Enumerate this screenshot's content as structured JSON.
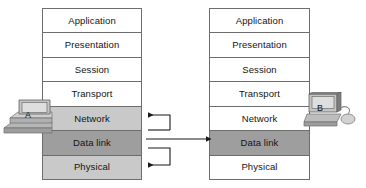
{
  "diagram": {
    "layers": [
      "Application",
      "Presentation",
      "Session",
      "Transport",
      "Network",
      "Data link",
      "Physical"
    ],
    "stack_a": {
      "device_label": "A",
      "layers": [
        {
          "name": "Application",
          "shade": "white"
        },
        {
          "name": "Presentation",
          "shade": "white"
        },
        {
          "name": "Session",
          "shade": "white"
        },
        {
          "name": "Transport",
          "shade": "white"
        },
        {
          "name": "Network",
          "shade": "light"
        },
        {
          "name": "Data link",
          "shade": "dark"
        },
        {
          "name": "Physical",
          "shade": "light"
        }
      ]
    },
    "stack_b": {
      "device_label": "B",
      "layers": [
        {
          "name": "Application",
          "shade": "white"
        },
        {
          "name": "Presentation",
          "shade": "white"
        },
        {
          "name": "Session",
          "shade": "white"
        },
        {
          "name": "Transport",
          "shade": "white"
        },
        {
          "name": "Network",
          "shade": "white"
        },
        {
          "name": "Data link",
          "shade": "dark"
        },
        {
          "name": "Physical",
          "shade": "white"
        }
      ]
    },
    "connectors": [
      {
        "name": "network-feedback-arrow",
        "description": "bracket from data link level looping up into the Network layer of stack A, arrowhead pointing left"
      },
      {
        "name": "data-link-peer-arrow",
        "description": "horizontal line from Data link of stack A to Data link of stack B, arrowhead pointing right"
      },
      {
        "name": "physical-feedback-arrow",
        "description": "bracket from data link level looping down into the Physical layer of stack A, arrowhead pointing left"
      }
    ],
    "colors": {
      "border": "#6d6d6d",
      "layer_white": "#ffffff",
      "layer_light": "#c9c9c9",
      "layer_dark": "#9e9e9e",
      "arrow": "#1a1a1a",
      "text": "#141414"
    }
  }
}
